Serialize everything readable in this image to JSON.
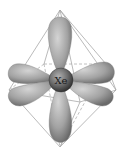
{
  "diagram": {
    "center_atom": "Xe",
    "geometry": "octahedral",
    "lobes": [
      "top",
      "bottom",
      "left-back",
      "left-front",
      "right-back",
      "right-front"
    ],
    "colors": {
      "lobe_light": "#c8c8c8",
      "lobe_dark": "#6e6e6e",
      "edge": "#a0a0a0",
      "atom_light": "#9a9a9a",
      "atom_dark": "#3c3c3c",
      "background": "#ffffff"
    }
  }
}
